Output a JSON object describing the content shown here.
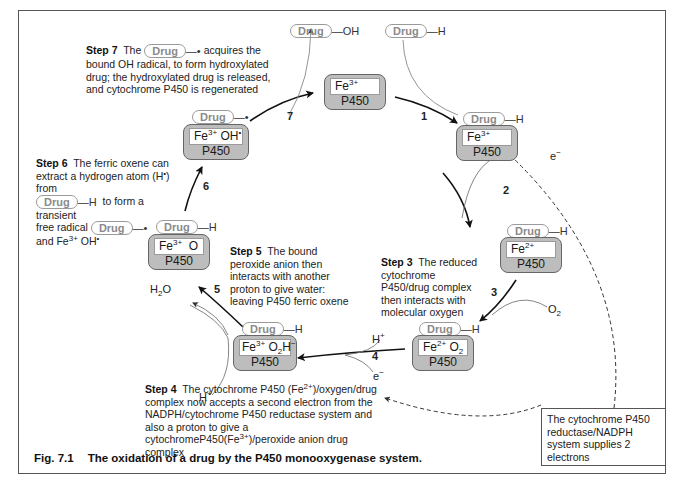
{
  "figure": {
    "number": "Fig. 7.1",
    "title": "The oxidation of a drug by the P450 monooxygenase system."
  },
  "common": {
    "drug_label": "Drug",
    "enzyme_label": "P450",
    "radical_dot": "•"
  },
  "complexes": {
    "resting": {
      "ion": "Fe",
      "charge": "3+",
      "ligand": ""
    },
    "bound": {
      "ion": "Fe",
      "charge": "3+",
      "ligand": "",
      "substrate": "H"
    },
    "reduced": {
      "ion": "Fe",
      "charge": "2+",
      "ligand": "",
      "substrate": "H"
    },
    "oxy": {
      "ion": "Fe",
      "charge": "2+",
      "ligand": "O",
      "ligand_sub": "2",
      "substrate": "H"
    },
    "peroxide": {
      "ion": "Fe",
      "charge": "3+",
      "ligand": "O",
      "ligand_sub": "2",
      "ligand_tail": "H",
      "ligand_charge": "−",
      "substrate": "H"
    },
    "oxene": {
      "ion": "Fe",
      "charge": "3+",
      "ligand": "O",
      "substrate": "H"
    },
    "hydroxyl": {
      "ion": "Fe",
      "charge": "3+",
      "ligand": "OH",
      "ligand_dot": "•"
    }
  },
  "free_species": {
    "drug_in_tail": "H",
    "drug_out_tail": "OH",
    "o2": {
      "base": "O",
      "sub": "2"
    },
    "water": {
      "base": "H",
      "sub": "2",
      "tail": "O"
    },
    "proton": {
      "base": "H",
      "sup": "+"
    },
    "electron": {
      "base": "e",
      "sup": "−"
    }
  },
  "step_numbers": [
    "1",
    "2",
    "3",
    "4",
    "5",
    "6",
    "7"
  ],
  "steps": {
    "step3": {
      "label": "Step 3",
      "text": "The reduced cytochrome P450/drug complex then interacts with molecular oxygen"
    },
    "step4": {
      "label": "Step 4",
      "text_a": "The cytochrome P450 (Fe",
      "sup_a": "2+",
      "text_b": ")/oxygen/drug complex now accepts a second electron from the NADPH/cytochrome P450 reductase system and also a proton to give a cytochromeP450(Fe",
      "sup_b": "3+",
      "text_c": ")/peroxide anion drug complex"
    },
    "step5": {
      "label": "Step 5",
      "text": "The bound peroxide anion then interacts with another proton to give water: leaving P450 ferric oxene"
    },
    "step6": {
      "label": "Step 6",
      "text_a": "The ferric oxene can extract a hydrogen atom (H",
      "sup_a": "•",
      "text_b": ") from",
      "text_c": "to form a transient",
      "text_d": "free radical",
      "text_e": "and Fe",
      "sup_e": "3+",
      "text_f": " OH",
      "sup_f": "•"
    },
    "step7": {
      "label": "Step 7",
      "text_a": "The",
      "text_b": "acquires the",
      "text_c": "bound OH radical, to form hydroxylated drug; the hydroxylated drug  is released, and  cytochrome P450 is regenerated"
    }
  },
  "reductase_note": "The cytochrome P450 reductase/NADPH system supplies 2 electrons"
}
